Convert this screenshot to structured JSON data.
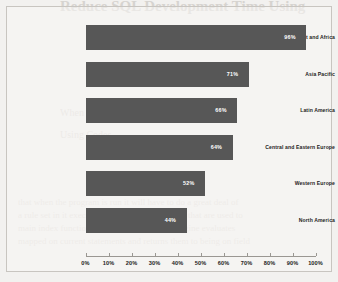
{
  "background_text": {
    "heading": "Reduce SQL Development Time Using",
    "subheading": "When Using",
    "sub2": "Using Codes",
    "body_lines": [
      "that when the program is run it will have to do a great deal of",
      "a rule set in it executes. SQL generates queries that are used to",
      "main index functions, queries and tasks the engine evaluates",
      "mapped on current statements and returns them to being on field"
    ]
  },
  "chart_data": {
    "type": "bar",
    "orientation": "horizontal",
    "title": "",
    "xlabel": "",
    "ylabel": "",
    "xlim": [
      0,
      100
    ],
    "grid": false,
    "legend": null,
    "bar_color": "#575757",
    "value_suffix": "%",
    "categories": [
      "Middle East and Africa",
      "Asia Pacific",
      "Latin America",
      "Central and Eastern Europe",
      "Western Europe",
      "North America"
    ],
    "values": [
      96,
      71,
      66,
      64,
      52,
      44
    ],
    "value_labels": [
      "96%",
      "71%",
      "66%",
      "64%",
      "52%",
      "44%"
    ],
    "tick_values": [
      0,
      10,
      20,
      30,
      40,
      50,
      60,
      70,
      80,
      90,
      100
    ],
    "tick_labels": [
      "0%",
      "10%",
      "20%",
      "30%",
      "40%",
      "50%",
      "60%",
      "70%",
      "80%",
      "90%",
      "100%"
    ]
  }
}
